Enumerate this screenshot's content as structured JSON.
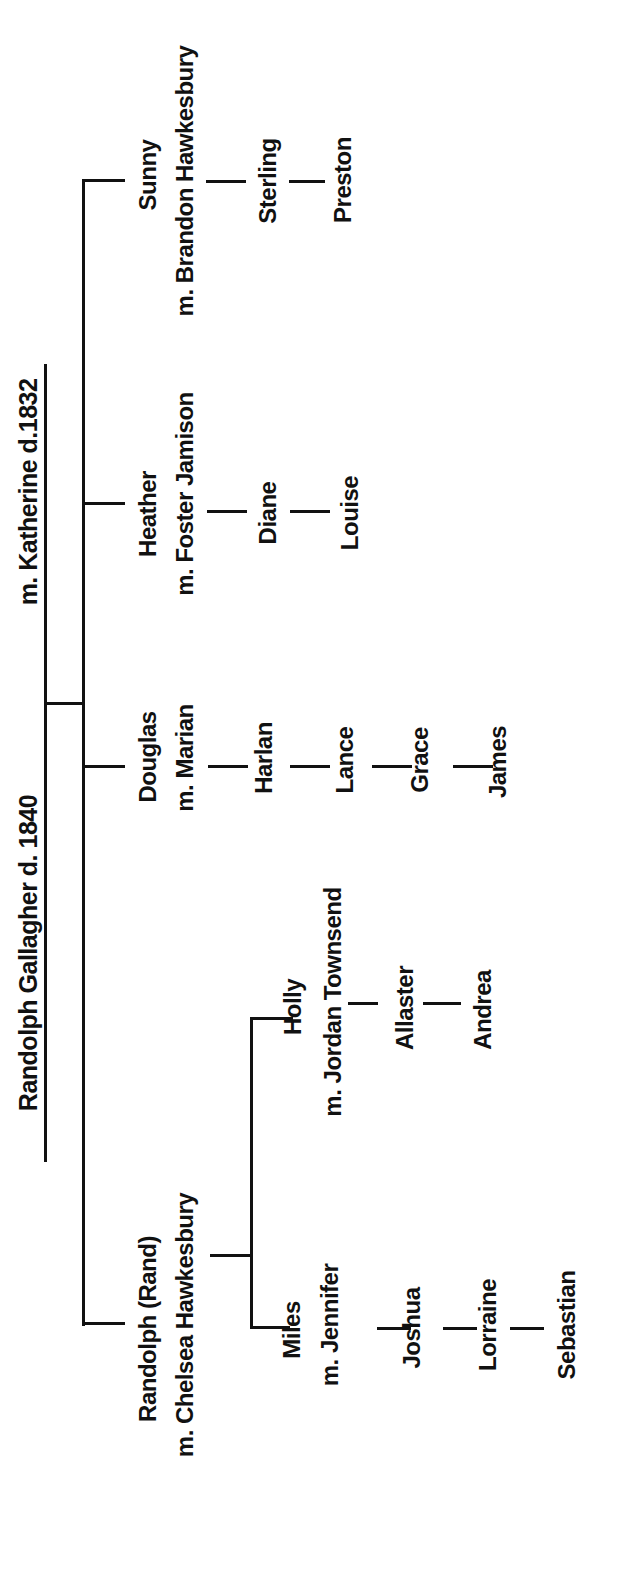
{
  "title": {
    "patriarch": "Randolph Gallagher  d. 1840",
    "spouse": "m. Katherine d.1832"
  },
  "children": [
    {
      "name": "Sunny",
      "spouse": "m. Brandon Hawkesbury",
      "descendants": [
        "Sterling",
        "Preston"
      ]
    },
    {
      "name": "Heather",
      "spouse": "m. Foster Jamison",
      "descendants": [
        "Diane",
        "Louise"
      ]
    },
    {
      "name": "Douglas",
      "spouse": "m. Marian",
      "descendants": [
        "Harlan",
        "Lance",
        "Grace",
        "James"
      ]
    },
    {
      "name": "Randolph (Rand)",
      "spouse": "m. Chelsea Hawkesbury",
      "children": [
        {
          "name": "Holly",
          "spouse": "m. Jordan Townsend",
          "descendants": [
            "Allaster",
            "Andrea"
          ]
        },
        {
          "name": "Miles",
          "spouse": "m. Jennifer",
          "descendants": [
            "Joshua",
            "Lorraine",
            "Sebastian"
          ]
        }
      ]
    }
  ],
  "colors": {
    "ink": "#111111",
    "background": "#ffffff"
  }
}
